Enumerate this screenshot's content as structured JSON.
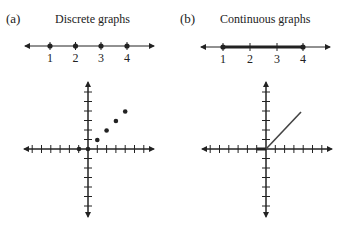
{
  "panels": [
    {
      "label": "(a)",
      "title": "Discrete graphs",
      "number_line": {
        "tick_labels": [
          "1",
          "2",
          "3",
          "4"
        ],
        "points": [
          1,
          2,
          3,
          4
        ],
        "connected": false
      },
      "plot": {
        "points": [
          [
            -1,
            0
          ],
          [
            0,
            0
          ],
          [
            1,
            1
          ],
          [
            2,
            2
          ],
          [
            3,
            3
          ],
          [
            4,
            4
          ]
        ],
        "x_range": [
          -7,
          7
        ],
        "y_range": [
          -7,
          7
        ]
      }
    },
    {
      "label": "(b)",
      "title": "Continuous graphs",
      "number_line": {
        "tick_labels": [
          "1",
          "2",
          "3",
          "4"
        ],
        "points": [
          1,
          2,
          3,
          4
        ],
        "connected": true
      },
      "plot": {
        "segments": [
          [
            [
              -1,
              0
            ],
            [
              0,
              0
            ]
          ],
          [
            [
              0,
              0
            ],
            [
              4,
              4
            ]
          ]
        ],
        "x_range": [
          -7,
          7
        ],
        "y_range": [
          -7,
          7
        ]
      }
    }
  ],
  "colors": {
    "ink": "#222222",
    "background": "#ffffff"
  }
}
